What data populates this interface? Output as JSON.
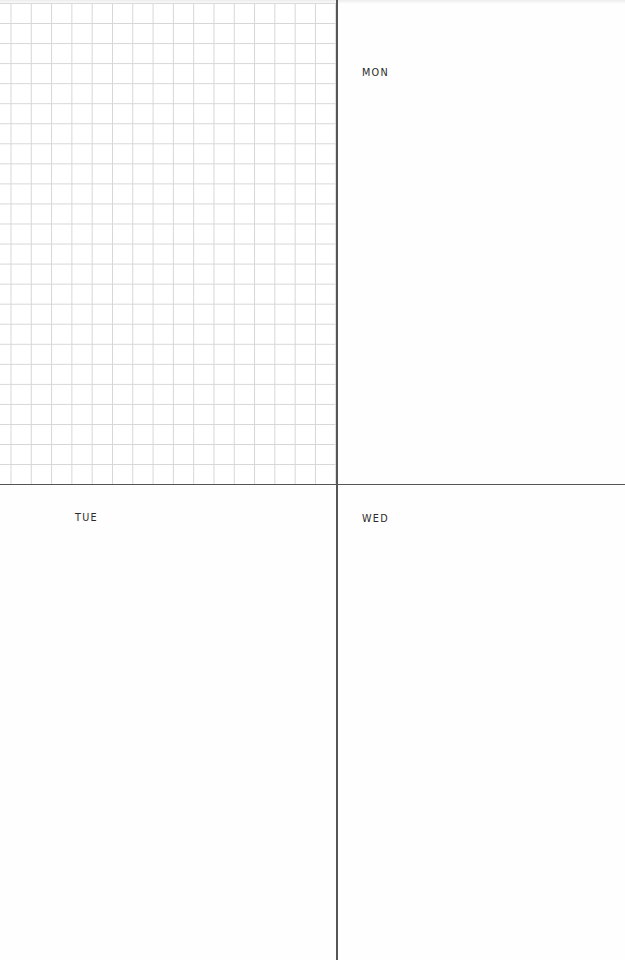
{
  "planner": {
    "type": "weekly-planner-spread",
    "notes_panel": {
      "style": "grid"
    },
    "days": [
      {
        "key": "mon",
        "label": "MON"
      },
      {
        "key": "tue",
        "label": "TUE"
      },
      {
        "key": "wed",
        "label": "WED"
      }
    ]
  },
  "colors": {
    "grid_line": "#d6d6d6",
    "divider": "#555555",
    "label_text": "#2a2a2a",
    "paper": "#ffffff"
  }
}
